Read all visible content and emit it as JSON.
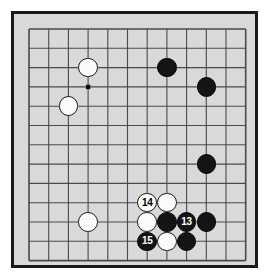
{
  "diagram": {
    "kind": "go-board-diagram",
    "board": {
      "columns": 12,
      "rows": 13,
      "origin_x": 15,
      "origin_y": 15,
      "spacing_x": 19.7,
      "spacing_y": 19.3,
      "background_color": "#d9d9d9",
      "line_color": "#4a4a4a",
      "frame_color": "#1a1a1a",
      "page_background": "#ffffff"
    },
    "star_points": [
      {
        "name": "star-point-upper-left",
        "col": 3,
        "row": 3
      }
    ],
    "stones": [
      {
        "name": "white-stone-c3",
        "color": "white",
        "col": 3,
        "row": 2,
        "label": ""
      },
      {
        "name": "black-stone-h3",
        "color": "black",
        "col": 7,
        "row": 2,
        "label": ""
      },
      {
        "name": "black-stone-j4",
        "color": "black",
        "col": 9,
        "row": 3,
        "label": ""
      },
      {
        "name": "white-stone-b5",
        "color": "white",
        "col": 2,
        "row": 4,
        "label": ""
      },
      {
        "name": "black-stone-j7",
        "color": "black",
        "col": 9,
        "row": 7,
        "label": ""
      },
      {
        "name": "white-stone-14",
        "color": "white",
        "col": 6,
        "row": 9,
        "label": "14"
      },
      {
        "name": "white-stone-g10",
        "color": "white",
        "col": 7,
        "row": 9,
        "label": ""
      },
      {
        "name": "white-stone-c11",
        "color": "white",
        "col": 3,
        "row": 10,
        "label": ""
      },
      {
        "name": "white-stone-f11",
        "color": "white",
        "col": 6,
        "row": 10,
        "label": ""
      },
      {
        "name": "black-stone-g11",
        "color": "black",
        "col": 7,
        "row": 10,
        "label": ""
      },
      {
        "name": "black-stone-13",
        "color": "black",
        "col": 8,
        "row": 10,
        "label": "13"
      },
      {
        "name": "black-stone-j11",
        "color": "black",
        "col": 9,
        "row": 10,
        "label": ""
      },
      {
        "name": "black-stone-15",
        "color": "black",
        "col": 6,
        "row": 11,
        "label": "15"
      },
      {
        "name": "white-stone-g12",
        "color": "white",
        "col": 7,
        "row": 11,
        "label": ""
      },
      {
        "name": "black-stone-h12",
        "color": "black",
        "col": 8,
        "row": 11,
        "label": ""
      }
    ],
    "move_labels": [
      "13",
      "14",
      "15"
    ]
  }
}
